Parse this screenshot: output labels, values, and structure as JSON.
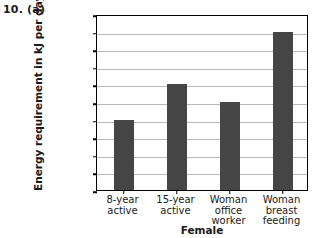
{
  "figure": {
    "question_number": "10. (a)"
  },
  "chart_data": {
    "type": "bar",
    "title": "",
    "xlabel": "Female",
    "ylabel": "Energy requirement in kJ per day",
    "categories": [
      "8-year active",
      "15-year active",
      "Woman office worker",
      "Woman breast feeding"
    ],
    "category_lines": [
      [
        "8-year",
        "active"
      ],
      [
        "15-year",
        "active"
      ],
      [
        "Woman",
        "office",
        "worker"
      ],
      [
        "Woman",
        "breast",
        "feeding"
      ]
    ],
    "values": [
      8000,
      12000,
      10000,
      18000
    ],
    "ylim": [
      0,
      20000
    ],
    "ytick_step": 2000,
    "yticks": [
      0,
      2000,
      4000,
      6000,
      8000,
      10000,
      12000,
      14000,
      16000,
      18000,
      20000
    ],
    "ytick_labels": [
      "0",
      "2000",
      "4000",
      "6000",
      "8000",
      "10000",
      "12000",
      "14000",
      "16000",
      "18000",
      "20000"
    ],
    "grid": true,
    "legend": "none",
    "bar_color": "#454545",
    "grid_color": "#b9b9b9",
    "axis_color": "#000000",
    "background_color": "#ffffff"
  }
}
